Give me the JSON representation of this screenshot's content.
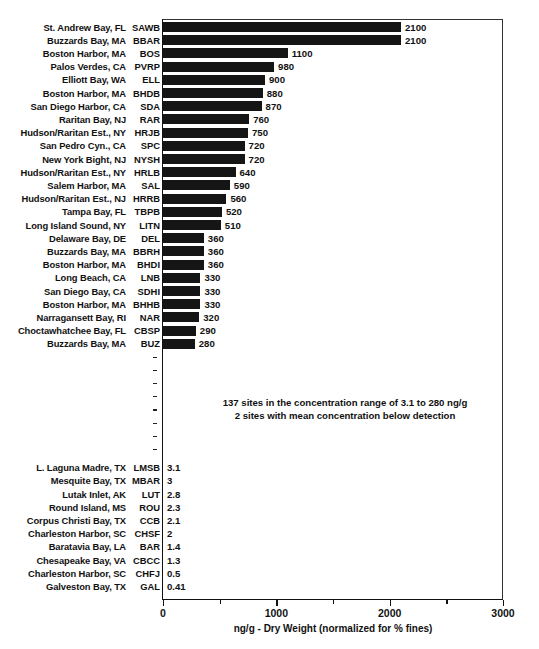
{
  "chart_data": {
    "type": "bar",
    "orientation": "horizontal",
    "title": "",
    "xlabel": "ng/g - Dry Weight (normalized for % fines)",
    "ylabel": "",
    "xlim": [
      0,
      3000
    ],
    "xticks": [
      0,
      1000,
      2000,
      3000
    ],
    "xtick_labels": [
      "0",
      "1000",
      "2000",
      "3000"
    ],
    "minor_xticks": [
      500,
      1500,
      2500
    ],
    "grid": false,
    "legend": null,
    "bar_color": "#151515",
    "categories": [
      "SAWB",
      "BBAR",
      "BOS",
      "PVRP",
      "ELL",
      "BHDB",
      "SDA",
      "RAR",
      "HRJB",
      "SPC",
      "NYSH",
      "HRLB",
      "SAL",
      "HRRB",
      "TBPB",
      "LITN",
      "DEL",
      "BBRH",
      "BHDI",
      "LNB",
      "SDHI",
      "BHHB",
      "NAR",
      "CBSP",
      "BUZ",
      "LMSB",
      "MBAR",
      "LUT",
      "ROU",
      "CCB",
      "CHSF",
      "BAR",
      "CBCC",
      "CHFJ",
      "GAL"
    ],
    "values": [
      2100,
      2100,
      1100,
      980,
      900,
      880,
      870,
      760,
      750,
      720,
      720,
      640,
      590,
      560,
      520,
      510,
      360,
      360,
      360,
      330,
      330,
      330,
      320,
      290,
      280,
      3.1,
      3,
      2.8,
      2.3,
      2.1,
      2,
      1.4,
      1.3,
      0.5,
      0.41
    ],
    "value_labels": [
      "2100",
      "2100",
      "1100",
      "980",
      "900",
      "880",
      "870",
      "760",
      "750",
      "720",
      "720",
      "640",
      "590",
      "560",
      "520",
      "510",
      "360",
      "360",
      "360",
      "330",
      "330",
      "330",
      "320",
      "290",
      "280",
      "3.1",
      "3",
      "2.8",
      "2.3",
      "2.1",
      "2",
      "1.4",
      "1.3",
      "0.5",
      "0.41"
    ],
    "site_names": [
      "St. Andrew Bay, FL",
      "Buzzards Bay, MA",
      "Boston Harbor, MA",
      "Palos Verdes, CA",
      "Elliott Bay, WA",
      "Boston Harbor, MA",
      "San Diego Harbor, CA",
      "Raritan Bay, NJ",
      "Hudson/Raritan Est., NY",
      "San Pedro Cyn., CA",
      "New York Bight, NJ",
      "Hudson/Raritan Est., NY",
      "Salem Harbor, MA",
      "Hudson/Raritan Est., NJ",
      "Tampa Bay, FL",
      "Long Island Sound, NY",
      "Delaware Bay, DE",
      "Buzzards Bay, MA",
      "Boston Harbor, MA",
      "Long Beach, CA",
      "San Diego Bay, CA",
      "Boston Harbor, MA",
      "Narragansett Bay, RI",
      "Choctawhatchee Bay, FL",
      "Buzzards Bay, MA",
      "L. Laguna Madre, TX",
      "Mesquite Bay, TX",
      "Lutak Inlet, AK",
      "Round Island, MS",
      "Corpus Christi Bay, TX",
      "Charleston Harbor, SC",
      "Baratavia Bay, LA",
      "Chesapeake Bay, VA",
      "Charleston Harbor, SC",
      "Galveston Bay, TX"
    ],
    "annotations": [
      "137 sites in the concentration range of 3.1 to 280 ng/g",
      "2 sites with mean concentration below detection"
    ],
    "omitted_rows_marker_count": 8
  },
  "axis": {
    "x_title": "ng/g - Dry Weight (normalized for % fines)"
  }
}
